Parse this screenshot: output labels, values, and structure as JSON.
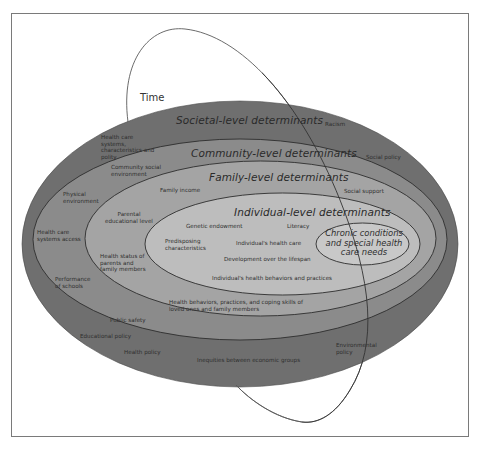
{
  "figure": {
    "time_label": "Time",
    "levels": {
      "societal": "Societal-level determinants",
      "community": "Community-level determinants",
      "family": "Family-level determinants",
      "individual": "Individual-level determinants",
      "core": "Chronic conditions and special health care needs"
    },
    "societal_items": [
      "Racism",
      "Social policy",
      "Health care systems, characteristics and polity",
      "Educational policy",
      "Health policy",
      "Inequities between economic groups",
      "Environmental policy"
    ],
    "community_items": [
      "Community social environment",
      "Physical environment",
      "Health care systems access",
      "Performance of schools",
      "Public safety",
      "Social support"
    ],
    "family_items": [
      "Family income",
      "Parental educational level",
      "Health status of parents and family members",
      "Health behaviors, practices, and coping skills of loved ones and family members"
    ],
    "individual_items": [
      "Genetic endowment",
      "Literacy",
      "Predisposing characteristics",
      "Individual's health care",
      "Development over the lifespan",
      "Individual's health behaviors and practices"
    ],
    "colors": {
      "societal": "#6e6e6e",
      "community": "#8a8a8a",
      "family": "#a3a3a3",
      "individual": "#bdbdbd",
      "core": "#c9c9c9",
      "outline": "#333333",
      "frame": "#7a7a7a"
    }
  }
}
